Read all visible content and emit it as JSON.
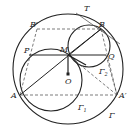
{
  "diagram": {
    "type": "geometry-figure",
    "circles": [
      {
        "name": "Gamma",
        "label": "Γ",
        "cx": 68,
        "cy": 69,
        "r": 55
      },
      {
        "name": "Gamma1",
        "label": "Γ",
        "subscript": "1",
        "cx": 51,
        "cy": 80,
        "r": 31
      },
      {
        "name": "Gamma2",
        "label": "Γ",
        "subscript": "2",
        "cx": 90,
        "cy": 47,
        "r": 22
      }
    ],
    "points": {
      "T": {
        "label": "T",
        "x": 86,
        "y": 10
      },
      "B": {
        "label": "B",
        "x": 101,
        "y": 29
      },
      "B_prime": {
        "label": "B′",
        "x": 37,
        "y": 29
      },
      "M": {
        "label": "M",
        "x": 68,
        "y": 55
      },
      "P": {
        "label": "P",
        "x": 29,
        "y": 55
      },
      "Q": {
        "label": "Q",
        "x": 106,
        "y": 55
      },
      "O": {
        "label": "O",
        "x": 68,
        "y": 74
      },
      "A": {
        "label": "A",
        "x": 20,
        "y": 95
      },
      "A_prime": {
        "label": "A′",
        "x": 117,
        "y": 95
      }
    },
    "labels": {
      "T": "T",
      "B": "B",
      "B_prime": "B′",
      "M": "M",
      "P": "P",
      "Q": "Q",
      "O": "O",
      "A": "A",
      "A_prime": "A′",
      "Gamma": "Γ",
      "Gamma1": "Γ",
      "Gamma1_sub": "1",
      "Gamma2": "Γ",
      "Gamma2_sub": "2"
    },
    "colors": {
      "stroke": "#222222",
      "background": "#ffffff"
    }
  }
}
